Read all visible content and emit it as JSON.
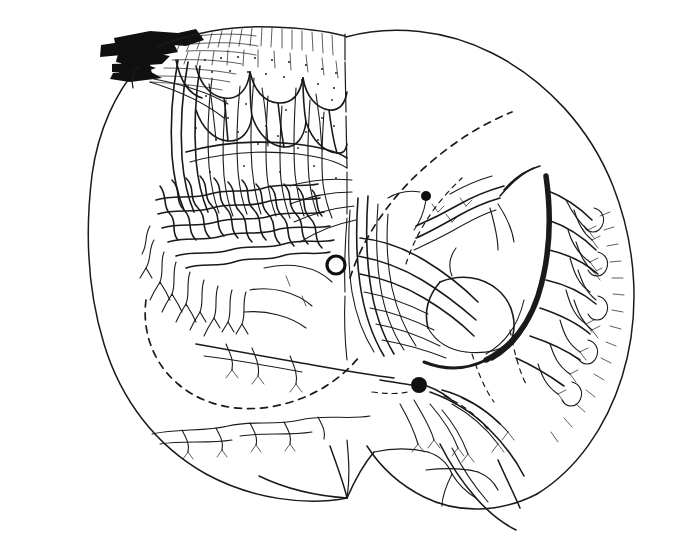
{
  "figure": {
    "domain": "scientific-illustration",
    "caption": "",
    "canvas": {
      "width": 676,
      "height": 544,
      "background": "#ffffff"
    },
    "ink_color": "#1a1a1a",
    "has_text_labels": false
  },
  "markers": [
    {
      "name": "open-circle-marker",
      "kind": "open ring",
      "x": 336,
      "y": 265,
      "radius": 9,
      "fill": "none",
      "stroke": "#101010"
    },
    {
      "name": "filled-dot-marker-lower",
      "kind": "filled ellipse",
      "x": 419,
      "y": 385,
      "radius": 8,
      "fill": "#101010"
    },
    {
      "name": "filled-dot-marker-upper",
      "kind": "filled ellipse",
      "x": 426,
      "y": 196,
      "radius": 5,
      "fill": "#101010"
    }
  ],
  "regions": [
    {
      "name": "left-hemisphere",
      "description": "stippled cortical body with dense neuropil tangle and scalloped glomerular folds"
    },
    {
      "name": "right-hemisphere",
      "description": "open outline with radiating dendritic arborization toward outer margin"
    },
    {
      "name": "midline-raphe",
      "description": "vertical boundary separating the two halves at x ≈ 345"
    },
    {
      "name": "cut-nerve-root",
      "description": "two heavy black fiber bundles entering at upper left"
    },
    {
      "name": "dashed-internal-boundary-upper-right",
      "description": "dashed arc tracing inner capsule boundary in upper right quadrant"
    },
    {
      "name": "dashed-internal-boundary-lower-left",
      "description": "dashed arc tracing inner boundary in lower left quadrant"
    },
    {
      "name": "heavy-fiber-tract-right",
      "description": "thick black arcing tract on right-center"
    }
  ],
  "legend": {
    "entries": []
  }
}
